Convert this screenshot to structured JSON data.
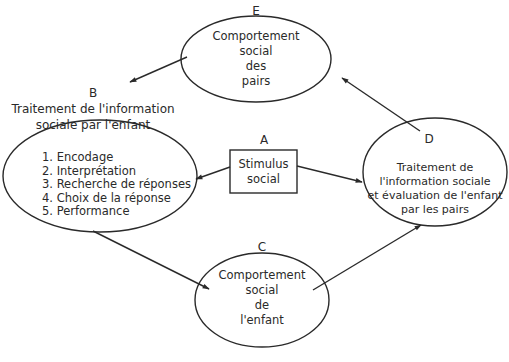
{
  "diagram": {
    "nodes": {
      "A": {
        "letter": "A",
        "lines": [
          "Stimulus",
          "social"
        ]
      },
      "B": {
        "letter": "B",
        "title_lines": [
          "Traitement de l'information",
          "sociale par l'enfant"
        ],
        "steps": [
          "1. Encodage",
          "2. Interprétation",
          "3. Recherche de réponses",
          "4. Choix de la réponse",
          "5. Performance"
        ]
      },
      "C": {
        "letter": "C",
        "lines": [
          "Comportement",
          "social",
          "de",
          "l'enfant"
        ]
      },
      "D": {
        "letter": "D",
        "lines": [
          "Traitement de",
          "l'information sociale",
          "et évaluation de l'enfant",
          "par les pairs"
        ]
      },
      "E": {
        "letter": "E",
        "lines": [
          "Comportement",
          "social",
          "des",
          "pairs"
        ]
      }
    },
    "edges": [
      {
        "from": "A",
        "to": "B"
      },
      {
        "from": "A",
        "to": "D"
      },
      {
        "from": "B",
        "to": "C"
      },
      {
        "from": "C",
        "to": "D"
      },
      {
        "from": "D",
        "to": "E"
      },
      {
        "from": "E",
        "to": "B"
      }
    ],
    "colors": {
      "stroke": "#2a2a2a",
      "text": "#2a2a2a",
      "background": "#ffffff"
    }
  }
}
